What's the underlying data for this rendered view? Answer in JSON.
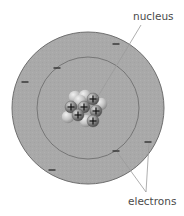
{
  "diagram": {
    "labels": {
      "nucleus": "nucleus",
      "electrons": "electrons"
    },
    "colors": {
      "shell_fill": "#a9a9a9",
      "shell_stroke": "#6e6e6e",
      "inner_ring_stroke": "#707070",
      "electron": "#3a3a3a",
      "proton": "#8a8a8a",
      "neutron": "#c4c4c4",
      "leader_line": "#9a9a9a",
      "label": "#4a4a4a"
    },
    "outer_shell": {
      "cx": 88,
      "cy": 108,
      "r": 76
    },
    "inner_shell": {
      "cx": 88,
      "cy": 108,
      "r": 51
    },
    "electrons": [
      {
        "shell": "outer",
        "x": 116,
        "y": 44
      },
      {
        "shell": "outer",
        "x": 25,
        "y": 82
      },
      {
        "shell": "outer",
        "x": 52,
        "y": 170
      },
      {
        "shell": "outer",
        "x": 148,
        "y": 142
      },
      {
        "shell": "inner",
        "x": 57,
        "y": 68
      },
      {
        "shell": "inner",
        "x": 116,
        "y": 151
      }
    ],
    "nucleus": {
      "protons": [
        {
          "x": 71,
          "y": 107,
          "symbol": "+"
        },
        {
          "x": 84,
          "y": 107,
          "symbol": "+"
        },
        {
          "x": 93,
          "y": 99,
          "symbol": "+"
        },
        {
          "x": 96,
          "y": 111,
          "symbol": "+"
        },
        {
          "x": 78,
          "y": 115,
          "symbol": "+"
        },
        {
          "x": 93,
          "y": 121,
          "symbol": "+"
        }
      ],
      "neutrons": [
        {
          "x": 75,
          "y": 97
        },
        {
          "x": 85,
          "y": 96
        },
        {
          "x": 101,
          "y": 104
        },
        {
          "x": 68,
          "y": 117
        },
        {
          "x": 86,
          "y": 121
        },
        {
          "x": 80,
          "y": 101
        }
      ]
    },
    "leader_lines": {
      "nucleus": {
        "x1": 141,
        "y1": 25,
        "x2": 97,
        "y2": 98
      },
      "electrons": [
        {
          "x1": 146,
          "y1": 192,
          "x2": 117,
          "y2": 152
        },
        {
          "x1": 146,
          "y1": 192,
          "x2": 149,
          "y2": 143
        }
      ]
    }
  }
}
